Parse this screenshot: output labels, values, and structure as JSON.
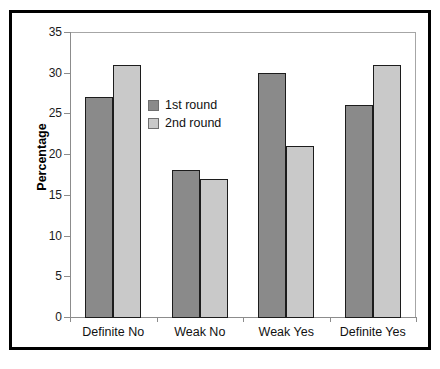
{
  "chart_data": {
    "type": "bar",
    "title": "",
    "xlabel": "",
    "ylabel": "Percentage",
    "ylim": [
      0,
      35
    ],
    "yticks": [
      0,
      5,
      10,
      15,
      20,
      25,
      30,
      35
    ],
    "ytick_labels": [
      "0",
      "5",
      "10",
      "15",
      "20",
      "25",
      "30",
      "35"
    ],
    "grid": false,
    "legend_position": "inside-upper-left",
    "categories": [
      "Definite No",
      "Weak No",
      "Weak Yes",
      "Definite Yes"
    ],
    "series": [
      {
        "name": "1st round",
        "color": "#8a8a8a",
        "values": [
          27,
          18,
          30,
          26
        ]
      },
      {
        "name": "2nd round",
        "color": "#c9c9c9",
        "values": [
          31,
          17,
          21,
          31
        ]
      }
    ]
  },
  "style": {
    "bar_edge_color": "#1c1c1c",
    "axis_color": "#8c8c8c",
    "plot_border_color": "#a6a6a6",
    "outer_border_color": "#000000",
    "background": "#ffffff"
  }
}
